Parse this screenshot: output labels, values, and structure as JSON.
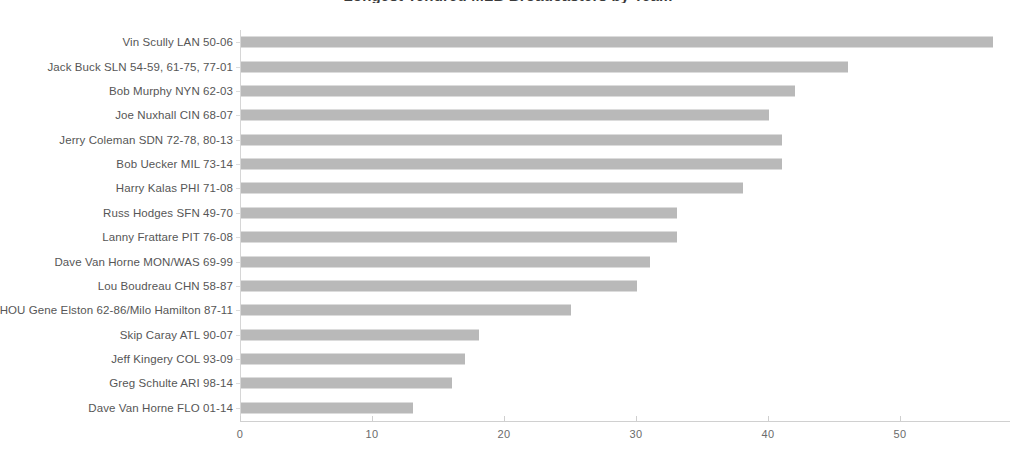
{
  "chart_data": {
    "type": "bar",
    "orientation": "horizontal",
    "title": "Longest Tenured MLB Broadcasters by Team",
    "xlabel": "",
    "ylabel": "",
    "xlim": [
      0,
      57.5
    ],
    "ylim": [
      0,
      16
    ],
    "grid": false,
    "legend": null,
    "bar_color": "#b9b9b9",
    "xticks": [
      0,
      10,
      20,
      30,
      40,
      50
    ],
    "xtick_labels": [
      "0",
      "10",
      "20",
      "30",
      "40",
      "50"
    ],
    "categories": [
      "Vin Scully LAN 50-06",
      "Jack Buck SLN 54-59, 61-75, 77-01",
      "Bob Murphy NYN 62-03",
      "Joe Nuxhall CIN 68-07",
      "Jerry Coleman SDN 72-78, 80-13",
      "Bob Uecker MIL 73-14",
      "Harry Kalas PHI 71-08",
      "Russ Hodges SFN 49-70",
      "Lanny Frattare PIT 76-08",
      "Dave Van Horne MON/WAS 69-99",
      "Lou Boudreau CHN 58-87",
      "HOU Gene Elston 62-86/Milo Hamilton 87-11",
      "Skip Caray ATL 90-07",
      "Jeff Kingery COL 93-09",
      "Greg Schulte ARI 98-14",
      "Dave Van Horne FLO 01-14"
    ],
    "values": [
      57,
      46,
      42,
      40,
      41,
      41,
      38,
      33,
      33,
      31,
      30,
      25,
      18,
      17,
      16,
      13
    ]
  }
}
